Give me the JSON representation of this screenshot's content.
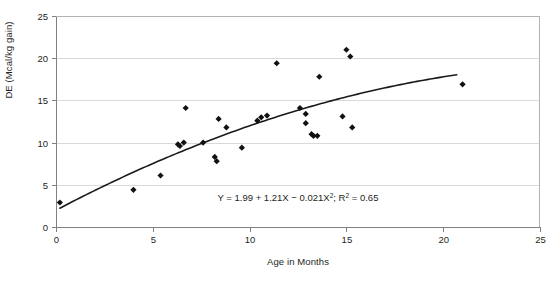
{
  "chart_data": {
    "type": "scatter",
    "title": "",
    "xlabel": "Age in Months",
    "ylabel": "DE (Mcal/kg gain)",
    "xlim": [
      0,
      25
    ],
    "ylim": [
      0,
      25
    ],
    "xticks": [
      0,
      5,
      10,
      15,
      20,
      25
    ],
    "yticks": [
      0,
      5,
      10,
      15,
      20,
      25
    ],
    "xtick_labels": [
      "0",
      "5",
      "10",
      "15",
      "20",
      "25"
    ],
    "ytick_labels": [
      "0",
      "5",
      "10",
      "15",
      "20",
      "25"
    ],
    "grid": "horizontal",
    "legend": "none",
    "marker": "filled-diamond",
    "marker_color": "#111111",
    "curve_color": "#1a1a1a",
    "gridline_color": "#d9d9d9",
    "axis_color": "#808080",
    "background": "#ffffff",
    "points": [
      {
        "x": 0.2,
        "y": 2.9
      },
      {
        "x": 4.0,
        "y": 4.4
      },
      {
        "x": 5.4,
        "y": 6.1
      },
      {
        "x": 6.3,
        "y": 9.8
      },
      {
        "x": 6.4,
        "y": 9.6
      },
      {
        "x": 6.6,
        "y": 10.0
      },
      {
        "x": 6.7,
        "y": 14.1
      },
      {
        "x": 7.6,
        "y": 10.0
      },
      {
        "x": 8.2,
        "y": 8.3
      },
      {
        "x": 8.3,
        "y": 7.8
      },
      {
        "x": 8.4,
        "y": 12.8
      },
      {
        "x": 8.8,
        "y": 11.8
      },
      {
        "x": 9.6,
        "y": 9.4
      },
      {
        "x": 10.4,
        "y": 12.6
      },
      {
        "x": 10.6,
        "y": 13.0
      },
      {
        "x": 10.9,
        "y": 13.2
      },
      {
        "x": 11.4,
        "y": 19.4
      },
      {
        "x": 12.6,
        "y": 14.1
      },
      {
        "x": 12.9,
        "y": 13.4
      },
      {
        "x": 12.9,
        "y": 12.3
      },
      {
        "x": 13.2,
        "y": 11.0
      },
      {
        "x": 13.3,
        "y": 10.8
      },
      {
        "x": 13.5,
        "y": 10.8
      },
      {
        "x": 13.6,
        "y": 17.8
      },
      {
        "x": 14.8,
        "y": 13.1
      },
      {
        "x": 15.0,
        "y": 21.0
      },
      {
        "x": 15.2,
        "y": 20.2
      },
      {
        "x": 15.3,
        "y": 11.8
      },
      {
        "x": 21.0,
        "y": 16.9
      }
    ],
    "fit": {
      "equation_text": "Y = 1.99 + 1.21X − 0.021X²; R² = 0.65",
      "equation_parts": {
        "lead": "Y = 1.99 + 1.21X − 0.021X",
        "sup1": "2",
        "mid": "; R",
        "sup2": "2",
        "tail": " = 0.65"
      },
      "intercept": 1.99,
      "linear": 1.21,
      "quadratic": -0.021,
      "r_squared": 0.65,
      "x_start": 0.2,
      "x_end": 20.7
    }
  }
}
